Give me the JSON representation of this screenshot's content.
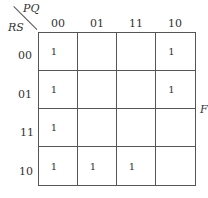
{
  "kmap": {
    "output_label": "F",
    "col_var": "PQ",
    "row_var": "RS",
    "col_headers": [
      "00",
      "01",
      "11",
      "10"
    ],
    "row_headers": [
      "00",
      "01",
      "11",
      "10"
    ],
    "cells": [
      [
        "1",
        "",
        "",
        "1"
      ],
      [
        "1",
        "",
        "",
        "1"
      ],
      [
        "1",
        "",
        "",
        ""
      ],
      [
        "1",
        "1",
        "1",
        ""
      ]
    ]
  }
}
